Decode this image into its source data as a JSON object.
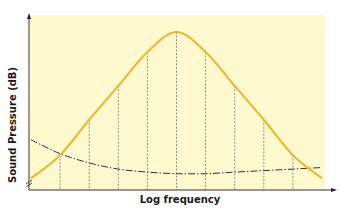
{
  "chart_data": {
    "type": "line",
    "title": "",
    "xlabel": "Log frequency",
    "ylabel": "Sound Pressure (dB)",
    "grid": false,
    "legend": null,
    "x_ticks": [],
    "y_ticks": [],
    "axis_break_at_origin": true,
    "background_color": "#fff9d0",
    "series": [
      {
        "name": "sound spectrum (bell curve)",
        "style": "solid",
        "color": "#f0b830",
        "x": [
          0,
          1,
          2,
          3,
          4,
          5,
          6,
          7,
          8,
          9,
          10
        ],
        "values": [
          5,
          20,
          43,
          65,
          87,
          100,
          87,
          65,
          43,
          20,
          5
        ]
      },
      {
        "name": "threshold curve",
        "style": "dash-dot",
        "color": "#333333",
        "x": [
          0,
          1,
          2,
          3,
          4,
          5,
          6,
          7,
          8,
          9,
          10
        ],
        "values": [
          30,
          21,
          15,
          11,
          9,
          8,
          8,
          9,
          10,
          11,
          12
        ]
      }
    ],
    "vertical_markers": {
      "style": "dashed",
      "count": 9,
      "x": [
        1,
        2,
        3,
        4,
        5,
        6,
        7,
        8,
        9
      ]
    }
  },
  "labels": {
    "x": "Log frequency",
    "y": "Sound Pressure (dB)"
  }
}
